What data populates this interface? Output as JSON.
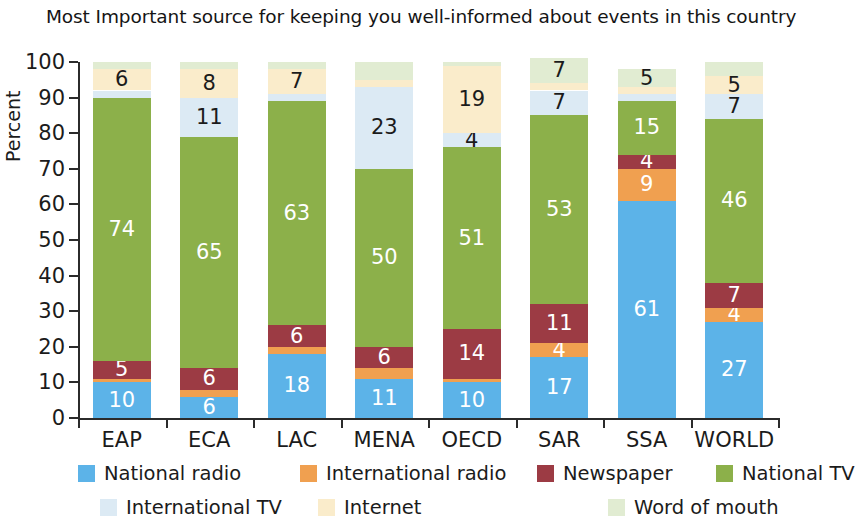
{
  "chart_data": {
    "type": "bar",
    "stacked": true,
    "title": "Most Important source for keeping you well-informed about events in this country",
    "xlabel": "",
    "ylabel": "Percent",
    "ylim": [
      0,
      100
    ],
    "yticks": [
      0,
      10,
      20,
      30,
      40,
      50,
      60,
      70,
      80,
      90,
      100
    ],
    "grid": false,
    "legend_position": "bottom",
    "categories": [
      "EAP",
      "ECA",
      "LAC",
      "MENA",
      "OECD",
      "SAR",
      "SSA",
      "WORLD"
    ],
    "series": [
      {
        "name": "National radio",
        "color": "#5cb3e8",
        "values": [
          10,
          6,
          18,
          11,
          10,
          17,
          61,
          27
        ],
        "labels": [
          "10",
          "6",
          "18",
          "11",
          "10",
          "17",
          "61",
          "27"
        ]
      },
      {
        "name": "International radio",
        "color": "#f0a050",
        "values": [
          1,
          2,
          2,
          3,
          1,
          4,
          9,
          4
        ],
        "labels": [
          "",
          "",
          "",
          "",
          "",
          "4",
          "9",
          "4"
        ]
      },
      {
        "name": "Newspaper",
        "color": "#9c3b44",
        "values": [
          5,
          6,
          6,
          6,
          14,
          11,
          4,
          7
        ],
        "labels": [
          "5",
          "6",
          "6",
          "6",
          "14",
          "11",
          "4",
          "7"
        ]
      },
      {
        "name": "National TV",
        "color": "#8cb04a",
        "values": [
          74,
          65,
          63,
          50,
          51,
          53,
          15,
          46
        ],
        "labels": [
          "74",
          "65",
          "63",
          "50",
          "51",
          "53",
          "15",
          "46"
        ]
      },
      {
        "name": "International TV",
        "color": "#dceaf4",
        "values": [
          2,
          11,
          2,
          23,
          4,
          7,
          2,
          7
        ],
        "labels": [
          "",
          "11",
          "",
          "23",
          "4",
          "7",
          "",
          "7"
        ]
      },
      {
        "name": "Internet",
        "color": "#faeccb",
        "values": [
          6,
          8,
          7,
          2,
          19,
          2,
          2,
          5
        ],
        "labels": [
          "6",
          "8",
          "7",
          "",
          "19",
          "",
          "",
          "5"
        ]
      },
      {
        "name": "Word of mouth",
        "color": "#e1ecd2",
        "values": [
          2,
          2,
          2,
          5,
          1,
          7,
          5,
          4
        ],
        "labels": [
          "",
          "",
          "",
          "",
          "",
          "7",
          "5",
          ""
        ]
      }
    ]
  },
  "legend": {
    "items": [
      {
        "label": "National radio",
        "color": "#5cb3e8"
      },
      {
        "label": "International radio",
        "color": "#f0a050"
      },
      {
        "label": "Newspaper",
        "color": "#9c3b44"
      },
      {
        "label": "National TV",
        "color": "#8cb04a"
      },
      {
        "label": "International TV",
        "color": "#dceaf4"
      },
      {
        "label": "Internet",
        "color": "#faeccb"
      },
      {
        "label": "Word of mouth",
        "color": "#e1ecd2"
      }
    ]
  }
}
